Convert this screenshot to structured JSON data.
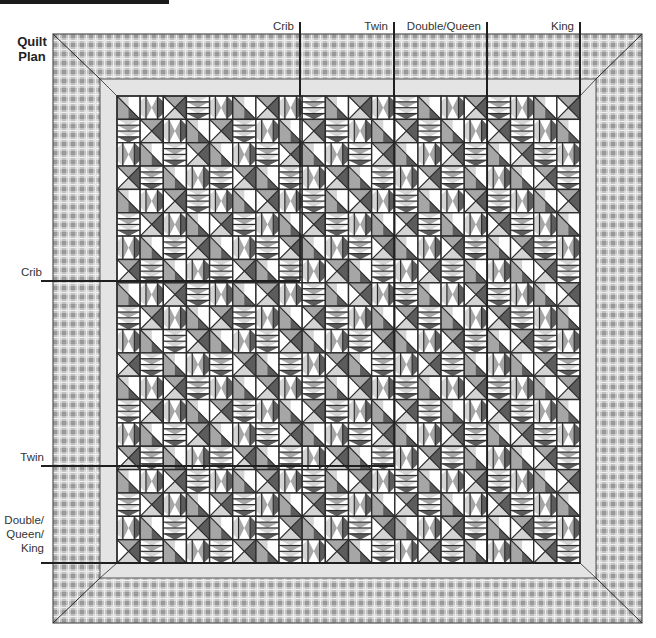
{
  "title": "Quilt Plan",
  "title_lines": [
    "Quilt",
    "Plan"
  ],
  "top_markers": [
    {
      "label": "Crib",
      "x": 300
    },
    {
      "label": "Twin",
      "x": 394
    },
    {
      "label": "Double/Queen",
      "x": 487
    },
    {
      "label": "King",
      "x": 580
    }
  ],
  "side_markers": [
    {
      "label_lines": [
        "Crib"
      ],
      "y": 281
    },
    {
      "label_lines": [
        "Twin"
      ],
      "y": 466
    },
    {
      "label_lines": [
        "Double/",
        "Queen/",
        "King"
      ],
      "y": 563
    }
  ],
  "colors": {
    "plaid_base": "#d9d9d9",
    "plaid_stripe": "#a9a9a9",
    "sashing": "#e4e4e4",
    "outline": "#2b2b2b",
    "tone_white": "#ffffff",
    "tone_light": "#d4d4d4",
    "tone_mid": "#a6a6a6",
    "tone_dark": "#5c5c5c"
  }
}
